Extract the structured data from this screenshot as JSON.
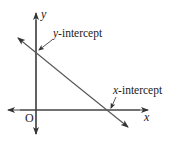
{
  "diagram": {
    "type": "linear-graph-intercepts",
    "axes": {
      "x_label": "x",
      "y_label": "y",
      "origin_label": "O"
    },
    "annotations": {
      "y_intercept": {
        "var": "y",
        "suffix": "-intercept"
      },
      "x_intercept": {
        "var": "x",
        "suffix": "-intercept"
      }
    },
    "colors": {
      "line": "#555555",
      "text": "#1a1a1a",
      "background": "#ffffff"
    }
  }
}
